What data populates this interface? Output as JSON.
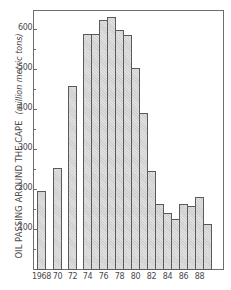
{
  "chart_data": {
    "type": "bar",
    "title": "",
    "xlabel": "",
    "ylabel": "OIL PASSING AROUND THE CAPE",
    "ylabel_unit": "(million metric tons)",
    "ylim": [
      0,
      660
    ],
    "grid": false,
    "legend": null,
    "y_ticks": [
      100,
      200,
      300,
      400,
      500,
      600
    ],
    "y_minor_ticks": [
      50,
      150,
      250,
      350,
      450,
      550
    ],
    "x_tick_labels": [
      "1968",
      "70",
      "72",
      "74",
      "76",
      "78",
      "80",
      "82",
      "84",
      "86",
      "88"
    ],
    "categories": [
      "1968",
      "1970",
      "1972",
      "1974",
      "1975",
      "1976",
      "1977",
      "1978",
      "1979",
      "1980",
      "1981",
      "1982",
      "1983",
      "1984",
      "1985",
      "1986",
      "1987",
      "1988",
      "1989"
    ],
    "values": [
      195,
      252,
      458,
      588,
      588,
      622,
      630,
      598,
      585,
      502,
      390,
      245,
      162,
      140,
      125,
      162,
      158,
      180,
      112
    ],
    "bar_color": "#cfcfcf",
    "bar_edge_color": "#5a5a5a"
  }
}
